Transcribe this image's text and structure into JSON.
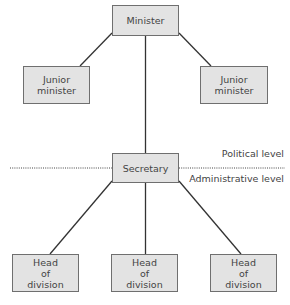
{
  "diagram": {
    "nodes": {
      "minister": "Minister",
      "junior_left": "Junior minister",
      "junior_right": "Junior minister",
      "secretary": "Secretary",
      "head_left": "Head of division",
      "head_middle": "Head of division",
      "head_right": "Head of division"
    },
    "levels": {
      "political": "Political level",
      "administrative": "Administrative level"
    },
    "colors": {
      "box_fill": "#e3e3e3",
      "box_border": "#6f6f6f",
      "line": "#333333"
    }
  }
}
